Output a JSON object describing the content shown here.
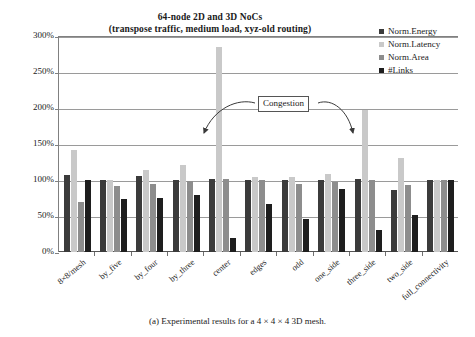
{
  "chart_data": {
    "type": "bar",
    "title": "64-node 2D and 3D NoCs (transpose traffic, medium load, xyz-old routing)",
    "title_lines": [
      "64-node 2D and 3D NoCs",
      "(transpose traffic, medium load, xyz-old routing)"
    ],
    "xlabel": "",
    "ylabel": "",
    "ylim": [
      0,
      300
    ],
    "ytick_labels": [
      "300%",
      "250%",
      "200%",
      "150%",
      "100%",
      "50%",
      "0%"
    ],
    "ytick_values": [
      300,
      250,
      200,
      150,
      100,
      50,
      0
    ],
    "grid": true,
    "legend_position": "top-right",
    "categories": [
      "8×8/mesh",
      "by_five",
      "by_four",
      "by_three",
      "center",
      "edges",
      "odd",
      "one_side",
      "three_side",
      "two_side",
      "full_connectivity"
    ],
    "series": [
      {
        "name": "Norm.Energy",
        "color": "#3b3b3b",
        "values": [
          107,
          100,
          105,
          100,
          101,
          100,
          100,
          100,
          101,
          86,
          100
        ]
      },
      {
        "name": "Norm.Latency",
        "color": "#c9c9c9",
        "values": [
          141,
          100,
          114,
          121,
          285,
          104,
          104,
          108,
          197,
          130,
          100
        ]
      },
      {
        "name": "Norm.Area",
        "color": "#8d8d8d",
        "values": [
          70,
          91,
          94,
          98,
          101,
          100,
          95,
          97,
          100,
          93,
          100
        ]
      },
      {
        "name": "#Links",
        "color": "#1e1e1e",
        "values": [
          100,
          74,
          75,
          79,
          20,
          66,
          46,
          88,
          30,
          52,
          100
        ]
      }
    ],
    "annotations": [
      {
        "text": "Congestion",
        "points_to": [
          "center",
          "three_side"
        ]
      }
    ]
  },
  "caption": "(a) Experimental results for a 4 × 4 × 4 3D mesh."
}
